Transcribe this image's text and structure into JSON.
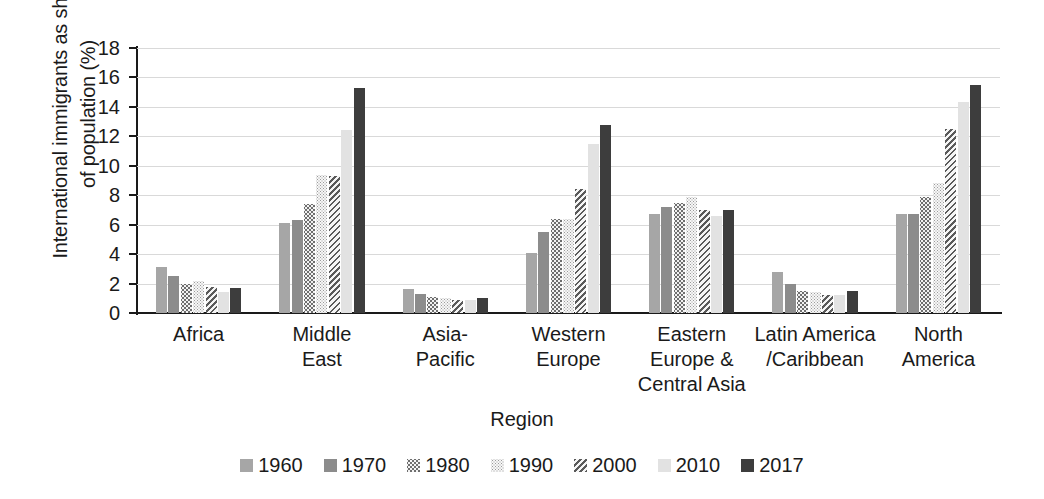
{
  "chart_data": {
    "type": "bar",
    "title": "",
    "xlabel": "Region",
    "ylabel": "International immigrants as share\nof population (%)",
    "ylim": [
      0,
      18
    ],
    "ytick_step": 2,
    "yticks": [
      "0",
      "2",
      "4",
      "6",
      "8",
      "10",
      "12",
      "14",
      "16",
      "18"
    ],
    "grid": "horizontal",
    "legend_position": "bottom",
    "categories": [
      "Africa",
      "Middle\nEast",
      "Asia-\nPacific",
      "Western\nEurope",
      "Eastern\nEurope &\nCentral Asia",
      "Latin America\n/Caribbean",
      "North\nAmerica"
    ],
    "series": [
      {
        "name": "1960",
        "color": "#a6a6a6",
        "pattern": "solid-mid-gray",
        "values": [
          3.1,
          6.1,
          1.6,
          4.1,
          6.7,
          2.8,
          6.7
        ]
      },
      {
        "name": "1970",
        "color": "#8c8c8c",
        "pattern": "solid-dark-gray",
        "values": [
          2.5,
          6.3,
          1.3,
          5.5,
          7.2,
          2.0,
          6.7
        ]
      },
      {
        "name": "1980",
        "color": "#6e6e6e",
        "pattern": "coarse-dots",
        "values": [
          2.0,
          7.4,
          1.1,
          6.4,
          7.5,
          1.5,
          7.9
        ]
      },
      {
        "name": "1990",
        "color": "#9a9a9a",
        "pattern": "fine-dots",
        "values": [
          2.2,
          9.4,
          1.0,
          6.4,
          7.9,
          1.4,
          8.8
        ]
      },
      {
        "name": "2000",
        "color": "#5a5a5a",
        "pattern": "diagonal-hatch",
        "values": [
          1.8,
          9.3,
          0.9,
          8.4,
          7.0,
          1.2,
          12.5
        ]
      },
      {
        "name": "2010",
        "color": "#e2e2e2",
        "pattern": "solid-light-gray",
        "values": [
          1.4,
          12.4,
          0.9,
          11.5,
          6.6,
          1.2,
          14.3
        ]
      },
      {
        "name": "2017",
        "color": "#3d3d3d",
        "pattern": "solid-near-black",
        "values": [
          1.7,
          15.3,
          1.0,
          12.8,
          7.0,
          1.5,
          15.5
        ]
      }
    ]
  }
}
